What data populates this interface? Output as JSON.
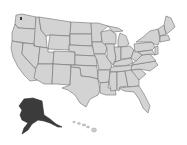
{
  "map": {
    "title": "",
    "region": "United States",
    "colors": {
      "background": "#ffffff",
      "state_fill": "#d3d3d3",
      "state_border": "#6e6e6e",
      "highlight_fill": "#3b3b3b"
    },
    "highlighted_states": [
      "Alaska"
    ],
    "default_states": [
      "Lower 48",
      "Hawaii"
    ],
    "markers": [
      {
        "label": "",
        "near": "Washington (Seattle area)"
      }
    ]
  }
}
